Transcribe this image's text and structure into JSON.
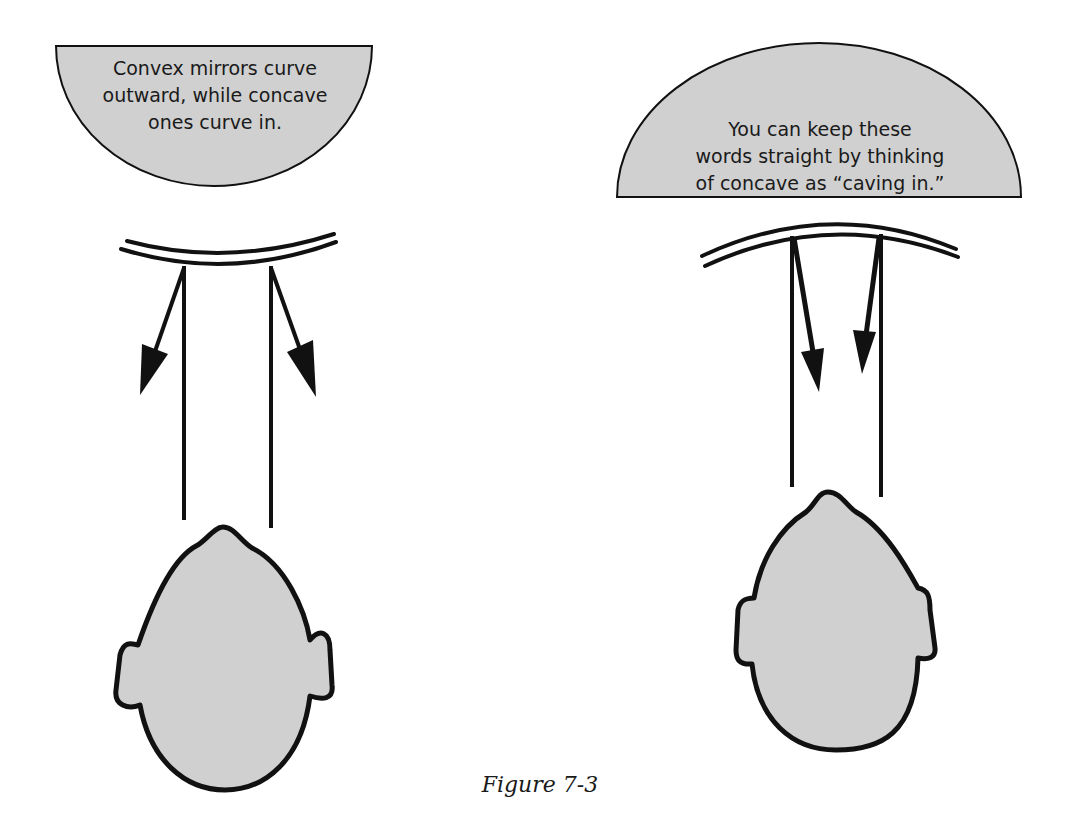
{
  "figure": {
    "caption": "Figure 7-3",
    "fill_color": "#d0d0d0",
    "stroke_color": "#111111"
  },
  "panels": [
    {
      "id": "convex",
      "callout": {
        "lines": [
          "Convex mirrors curve",
          "outward, while concave",
          "ones curve in."
        ]
      },
      "mirror_type": "convex",
      "elements": [
        "mirror",
        "incident-ray-left",
        "incident-ray-right",
        "reflected-arrow-left",
        "reflected-arrow-right",
        "head"
      ]
    },
    {
      "id": "concave",
      "callout": {
        "lines": [
          "You can keep these",
          "words straight by thinking",
          "of concave as “caving in.”"
        ]
      },
      "mirror_type": "concave",
      "elements": [
        "mirror",
        "incident-ray-left",
        "incident-ray-right",
        "reflected-arrow-left",
        "reflected-arrow-right",
        "head"
      ]
    }
  ]
}
